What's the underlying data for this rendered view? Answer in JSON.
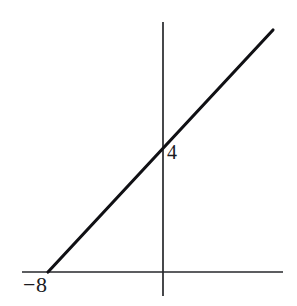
{
  "figure": {
    "background_color": "#ffffff",
    "width": 297,
    "height": 306
  },
  "labels": {
    "x_intercept": "−8",
    "y_intercept": "4"
  },
  "chart_data": {
    "type": "line",
    "title": "",
    "subtitle": "",
    "xlabel": "",
    "ylabel": "",
    "grid": false,
    "legend": false,
    "legend_position": "none",
    "series": [
      {
        "name": "line",
        "equation": "y = x/2 + 4",
        "slope": 0.5,
        "y_intercept": 4,
        "x_intercept": -8,
        "color": "#101014",
        "line_width": 3,
        "x": [
          -11.5,
          9.8
        ],
        "y": [
          -1.75,
          8.9
        ],
        "endpoints_px": [
          [
            48,
            272
          ],
          [
            273,
            30
          ]
        ]
      }
    ],
    "annotations": [
      {
        "text": "−8",
        "data_x": -8,
        "data_y": 0,
        "pixel_x": 40,
        "pixel_y": 288,
        "describes": "x-intercept"
      },
      {
        "text": "4",
        "data_x": 0,
        "data_y": 4,
        "pixel_x": 173,
        "pixel_y": 155,
        "describes": "y-intercept"
      }
    ],
    "axes": {
      "x_axis": {
        "visible": true,
        "color": "#26272b",
        "pixel_y": 272,
        "pixel_x_start": 22,
        "pixel_x_end": 283,
        "ticks": [],
        "tick_labels": []
      },
      "y_axis": {
        "visible": true,
        "color": "#26272b",
        "pixel_x": 163,
        "pixel_y_start": 22,
        "pixel_y_end": 296,
        "ticks": [],
        "tick_labels": []
      },
      "origin_px": [
        163,
        272
      ],
      "pixels_per_unit_x": 14.4,
      "pixels_per_unit_y": 28.8,
      "xlim": [
        -9.8,
        8.3
      ],
      "ylim": [
        -0.85,
        8.7
      ]
    }
  }
}
